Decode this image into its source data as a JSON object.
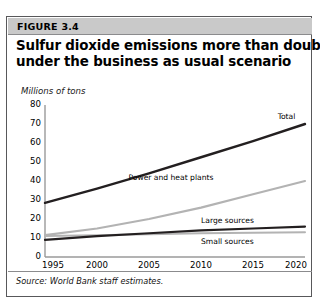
{
  "figure": {
    "number_label": "FIGURE 3.4",
    "title_line1": "Sulfur dioxide emissions more than double",
    "title_line2": "under the business as usual scenario",
    "source_note": "Source: World Bank staff estimates.",
    "page_top_fragment": ""
  },
  "chart_data": {
    "type": "line",
    "title": "Sulfur dioxide emissions more than double under the business as usual scenario",
    "subtitle": "",
    "xlabel": "",
    "ylabel": "Millions of tons",
    "ylim": [
      0,
      80
    ],
    "xlim": [
      1995,
      2020
    ],
    "yticks": [
      0,
      10,
      20,
      30,
      40,
      50,
      60,
      70,
      80
    ],
    "xticks": [
      1995,
      2000,
      2005,
      2010,
      2015,
      2020
    ],
    "grid": false,
    "legend_position": "inline-right-of-line-ends",
    "x": [
      1995,
      2000,
      2005,
      2010,
      2015,
      2020
    ],
    "series": [
      {
        "name": "Total",
        "values": [
          28.5,
          36.0,
          44.0,
          52.5,
          61.0,
          70.0
        ],
        "color": "#231f20",
        "width": 2.4,
        "label_x": 2019.1,
        "label_y": 73.5
      },
      {
        "name": "Power and heat plants",
        "values": [
          11.5,
          15.0,
          20.0,
          26.0,
          33.0,
          40.0
        ],
        "color": "#b3b3b3",
        "width": 2.2,
        "label_x": 2011.2,
        "label_y": 41.5
      },
      {
        "name": "Large sources",
        "values": [
          9.0,
          11.0,
          12.5,
          14.0,
          15.0,
          16.0
        ],
        "color": "#231f20",
        "width": 2.2,
        "label_x": 2015.1,
        "label_y": 19.0
      },
      {
        "name": "Small sources",
        "values": [
          11.0,
          11.5,
          12.0,
          12.5,
          12.7,
          13.0
        ],
        "color": "#b3b3b3",
        "width": 2.0,
        "label_x": 2015.1,
        "label_y": 8.0
      }
    ],
    "axis_color": "#9a9a9a"
  },
  "colors": {
    "frame": "#58585a",
    "header_band": "#c9c9c9",
    "dark_series": "#231f20",
    "light_series": "#b3b3b3",
    "axis": "#9a9a9a"
  }
}
